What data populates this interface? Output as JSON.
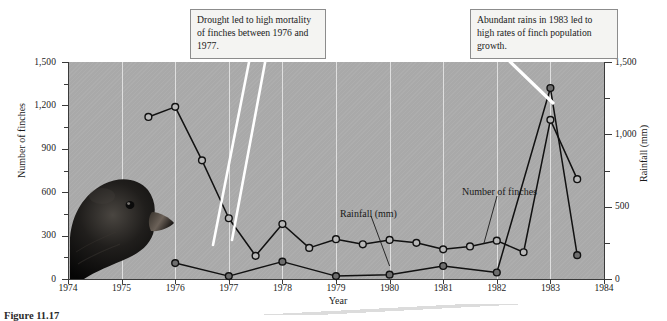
{
  "chart_data": {
    "type": "line",
    "title": "",
    "xlabel": "Year",
    "ylabel": "Number of finches",
    "y2label": "Rainfall (mm)",
    "xlim": [
      1974,
      1984
    ],
    "ylim": [
      0,
      1500
    ],
    "y2lim": [
      0,
      1500
    ],
    "grid": true,
    "legend_position": "inline-annotation",
    "x_ticks": [
      "1974",
      "1975",
      "1976",
      "1977",
      "1978",
      "1979",
      "1980",
      "1981",
      "1982",
      "1983",
      "1984"
    ],
    "y_ticks_left": [
      "0",
      "300",
      "600",
      "900",
      "1,200",
      "1,500"
    ],
    "y_ticks_right": [
      "0",
      "500",
      "1,000",
      "1,500"
    ],
    "series": [
      {
        "name": "Number of finches",
        "marker": "open-circle",
        "axis": "left",
        "points": [
          {
            "x": 1975.5,
            "y": 1120
          },
          {
            "x": 1976.0,
            "y": 1190
          },
          {
            "x": 1976.5,
            "y": 820
          },
          {
            "x": 1977.0,
            "y": 420
          },
          {
            "x": 1977.5,
            "y": 160
          },
          {
            "x": 1978.0,
            "y": 380
          },
          {
            "x": 1978.5,
            "y": 215
          },
          {
            "x": 1979.0,
            "y": 275
          },
          {
            "x": 1979.5,
            "y": 240
          },
          {
            "x": 1980.0,
            "y": 270
          },
          {
            "x": 1980.5,
            "y": 250
          },
          {
            "x": 1981.0,
            "y": 205
          },
          {
            "x": 1981.5,
            "y": 225
          },
          {
            "x": 1982.0,
            "y": 265
          },
          {
            "x": 1982.5,
            "y": 185
          },
          {
            "x": 1983.0,
            "y": 1100
          },
          {
            "x": 1983.5,
            "y": 690
          }
        ]
      },
      {
        "name": "Rainfall (mm)",
        "marker": "filled-circle",
        "axis": "right",
        "points": [
          {
            "x": 1976.0,
            "y": 110
          },
          {
            "x": 1977.0,
            "y": 20
          },
          {
            "x": 1978.0,
            "y": 120
          },
          {
            "x": 1979.0,
            "y": 20
          },
          {
            "x": 1980.0,
            "y": 30
          },
          {
            "x": 1981.0,
            "y": 90
          },
          {
            "x": 1982.0,
            "y": 45
          },
          {
            "x": 1983.0,
            "y": 1320
          },
          {
            "x": 1983.5,
            "y": 165
          }
        ]
      }
    ]
  },
  "annotations": {
    "drought": "Drought led to high mortality of finches between 1976 and 1977.",
    "rains": "Abundant rains in 1983 led to high rates of finch population growth."
  },
  "inline_labels": {
    "rainfall": "Rainfall (mm)",
    "finches": "Number of finches"
  },
  "axes": {
    "left_title": "Number of finches",
    "right_title": "Rainfall (mm)",
    "x_title": "Year"
  },
  "caption": {
    "text": "Figure 11.17"
  },
  "colors": {
    "plot_background": "#a9a9a9",
    "gridline": "#e9e9e9",
    "line": "#111111",
    "finch_marker_fill": "#b9b9b9",
    "rain_marker_fill": "#6e6e6e",
    "callout_background": "#f4f4f2",
    "callout_border": "#8c8c8c",
    "leader_line": "#ffffff"
  },
  "media": {
    "bird_photo": "finch-photo"
  }
}
